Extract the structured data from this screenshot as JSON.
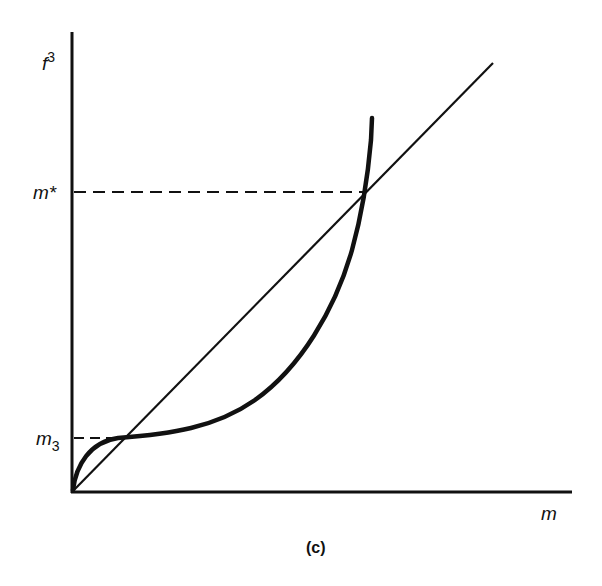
{
  "figure": {
    "caption": "(c)",
    "y_axis_label": "f",
    "y_axis_label_sup": "3",
    "x_axis_label": "m",
    "tick_labels": {
      "m_star": "m*",
      "m3_base": "m",
      "m3_sub": "3"
    }
  },
  "colors": {
    "ink": "#111111",
    "background": "#ffffff"
  },
  "elements": {
    "y_axis": {
      "from": [
        72,
        492
      ],
      "to": [
        72,
        32
      ]
    },
    "x_axis": {
      "from": [
        72,
        492
      ],
      "to": [
        572,
        492
      ]
    },
    "diagonal_45deg": {
      "from": [
        72,
        492
      ],
      "to": [
        493,
        63
      ]
    },
    "dashed_m_star": {
      "y": 192,
      "x_from": 72,
      "x_to": 366
    },
    "dashed_m3": {
      "y": 438,
      "x_from": 72,
      "x_to": 120
    },
    "curve_f3": "cubic-like curve: rises steeply from origin, flattens at m3, then accelerates to vertical asymptote crossing diagonal at m*"
  }
}
